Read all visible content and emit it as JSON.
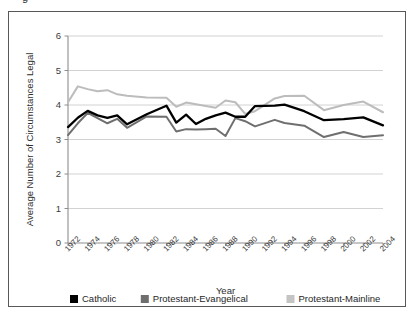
{
  "figure": {
    "top_fragment": "g",
    "frame_border_color": "#58585a"
  },
  "chart_data": {
    "type": "line",
    "title": "",
    "xlabel": "Year",
    "ylabel": "Average Number of Circumstances Legal",
    "xlim": [
      1972,
      2004
    ],
    "ylim": [
      0,
      6
    ],
    "yticks": [
      0,
      1,
      2,
      3,
      4,
      5,
      6
    ],
    "ytick_labels": [
      "0",
      "1",
      "2",
      "3",
      "4",
      "5",
      "6"
    ],
    "xticks": [
      1972,
      1974,
      1976,
      1978,
      1980,
      1982,
      1984,
      1986,
      1988,
      1990,
      1992,
      1994,
      1996,
      1998,
      2000,
      2002,
      2004
    ],
    "xtick_labels": [
      "1972",
      "1974",
      "1976",
      "1978",
      "1980",
      "1982",
      "1984",
      "1986",
      "1988",
      "1990",
      "1992",
      "1994",
      "1996",
      "1998",
      "2000",
      "2002",
      "2004"
    ],
    "grid": "horizontal",
    "legend_position": "bottom",
    "x": [
      1972,
      1973,
      1974,
      1975,
      1976,
      1977,
      1978,
      1980,
      1982,
      1983,
      1984,
      1985,
      1986,
      1987,
      1988,
      1989,
      1990,
      1991,
      1993,
      1994,
      1996,
      1998,
      2000,
      2002,
      2004
    ],
    "series": [
      {
        "name": "Catholic",
        "color": "#000000",
        "values": [
          3.36,
          3.63,
          3.83,
          3.7,
          3.63,
          3.7,
          3.44,
          3.73,
          3.98,
          3.49,
          3.72,
          3.45,
          3.6,
          3.7,
          3.78,
          3.66,
          3.66,
          3.97,
          3.98,
          4.01,
          3.82,
          3.56,
          3.59,
          3.64,
          3.41
        ]
      },
      {
        "name": "Protestant-Evangelical",
        "color": "#6f6f6f",
        "values": [
          3.13,
          3.47,
          3.77,
          3.62,
          3.47,
          3.6,
          3.34,
          3.67,
          3.66,
          3.23,
          3.3,
          3.29,
          3.3,
          3.31,
          3.1,
          3.62,
          3.53,
          3.38,
          3.57,
          3.48,
          3.4,
          3.07,
          3.22,
          3.07,
          3.12
        ]
      },
      {
        "name": "Protestant-Mainline",
        "color": "#bcbcbc",
        "values": [
          4.08,
          4.54,
          4.46,
          4.4,
          4.43,
          4.31,
          4.27,
          4.22,
          4.21,
          3.95,
          4.07,
          4.02,
          3.97,
          3.92,
          4.13,
          4.08,
          3.74,
          3.82,
          4.19,
          4.26,
          4.27,
          3.85,
          4.0,
          4.1,
          3.79
        ]
      }
    ],
    "legend": [
      {
        "label": "Catholic",
        "color": "#000000"
      },
      {
        "label": "Protestant-Evangelical",
        "color": "#6f6f6f"
      },
      {
        "label": "Protestant-Mainline",
        "color": "#c4c4c4"
      }
    ]
  }
}
